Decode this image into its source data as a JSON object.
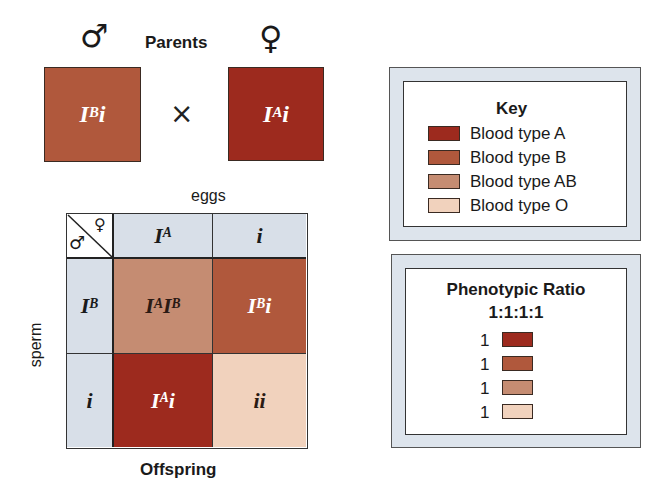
{
  "title": "Parents",
  "male_symbol": "♂",
  "female_symbol": "♀",
  "cross_symbol": "×",
  "parents": {
    "male": {
      "allele1": "I",
      "sup1": "B",
      "allele2": "i",
      "color": "#b0583c"
    },
    "female": {
      "allele1": "I",
      "sup1": "A",
      "allele2": "i",
      "color": "#9d2a1e"
    }
  },
  "punnett": {
    "top_label": "eggs",
    "side_label": "sperm",
    "bottom_label": "Offspring",
    "eggs": [
      {
        "base": "I",
        "sup": "A"
      },
      {
        "base": "i",
        "sup": ""
      }
    ],
    "sperm": [
      {
        "base": "I",
        "sup": "B"
      },
      {
        "base": "i",
        "sup": ""
      }
    ],
    "cells": [
      {
        "a": "I",
        "a_sup": "A",
        "b": "I",
        "b_sup": "B",
        "phenotype": "AB",
        "color": "#c58c72",
        "text_color": "#2a1a14"
      },
      {
        "a": "I",
        "a_sup": "B",
        "b": "i",
        "b_sup": "",
        "phenotype": "B",
        "color": "#b0583c",
        "text_color": "#ffffff"
      },
      {
        "a": "I",
        "a_sup": "A",
        "b": "i",
        "b_sup": "",
        "phenotype": "A",
        "color": "#9d2a1e",
        "text_color": "#ffffff"
      },
      {
        "a": "i",
        "a_sup": "",
        "b": "i",
        "b_sup": "",
        "phenotype": "O",
        "color": "#f1d2bd",
        "text_color": "#2a1a14"
      }
    ]
  },
  "key": {
    "title": "Key",
    "items": [
      {
        "label": "Blood type A",
        "color": "#9d2a1e"
      },
      {
        "label": "Blood type B",
        "color": "#b0583c"
      },
      {
        "label": "Blood type AB",
        "color": "#c58c72"
      },
      {
        "label": "Blood type O",
        "color": "#f1d2bd"
      }
    ]
  },
  "ratio": {
    "title": "Phenotypic Ratio",
    "value": "1:1:1:1",
    "items": [
      {
        "count": "1",
        "color": "#9d2a1e"
      },
      {
        "count": "1",
        "color": "#b0583c"
      },
      {
        "count": "1",
        "color": "#c58c72"
      },
      {
        "count": "1",
        "color": "#f1d2bd"
      }
    ]
  },
  "colors": {
    "gamete_bg": "#d8dfe8",
    "panel_border_bg": "#dde4ec"
  }
}
